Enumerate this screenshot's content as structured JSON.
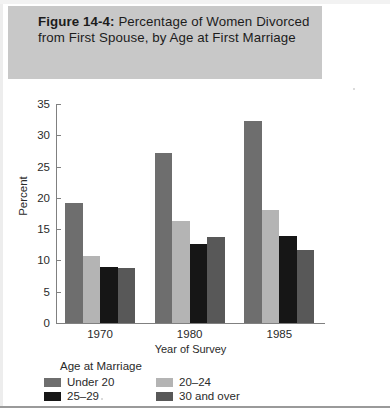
{
  "figure": {
    "label": "Figure 14-4:",
    "title": "Percentage of Women Divorced from First Spouse, by Age at First Marriage"
  },
  "axes": {
    "ylabel": "Percent",
    "xlabel": "Year of Survey",
    "yticks": [
      "0",
      "5",
      "10",
      "15",
      "20",
      "25",
      "30",
      "35"
    ]
  },
  "legend": {
    "title": "Age at Marriage",
    "items": [
      {
        "label": "Under 20",
        "color": "#6e6e6e"
      },
      {
        "label": "20–24",
        "color": "#b4b4b4"
      },
      {
        "label": "25–29",
        "color": "#161616"
      },
      {
        "label": "30 and over",
        "color": "#585858"
      }
    ]
  },
  "chart_data": {
    "type": "bar",
    "title": "Figure 14-4: Percentage of Women Divorced from First Spouse, by Age at First Marriage",
    "xlabel": "Year of Survey",
    "ylabel": "Percent",
    "categories": [
      "1970",
      "1980",
      "1985"
    ],
    "ylim": [
      0,
      35
    ],
    "ytick_step": 5,
    "grid": false,
    "legend_position": "bottom",
    "legend_title": "Age at Marriage",
    "series": [
      {
        "name": "Under 20",
        "color": "#6e6e6e",
        "values": [
          19.4,
          27.3,
          32.4
        ]
      },
      {
        "name": "20–24",
        "color": "#b4b4b4",
        "values": [
          10.9,
          16.4,
          18.3
        ]
      },
      {
        "name": "25–29",
        "color": "#161616",
        "values": [
          9.1,
          12.8,
          14.1
        ]
      },
      {
        "name": "30 and over",
        "color": "#585858",
        "values": [
          9.0,
          13.9,
          11.9
        ]
      }
    ]
  }
}
